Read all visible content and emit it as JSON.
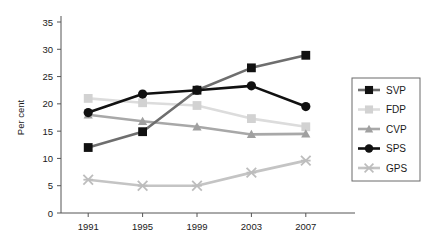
{
  "chart_data": {
    "type": "line",
    "title": "",
    "subtitle": "",
    "xlabel": "",
    "ylabel": "Per cent",
    "categories": [
      "1991",
      "1995",
      "1999",
      "2003",
      "2007"
    ],
    "x": [
      1991,
      1995,
      1999,
      2003,
      2007
    ],
    "ylim": [
      0,
      35
    ],
    "yticks": [
      0,
      5,
      10,
      15,
      20,
      25,
      30,
      35
    ],
    "ytick_labels": [
      "0",
      "5",
      "10",
      "15",
      "20",
      "25",
      "30",
      "35"
    ],
    "xtick_labels": [
      "1991",
      "1995",
      "1999",
      "2003",
      "2007"
    ],
    "grid": false,
    "legend_position": "right",
    "series": [
      {
        "name": "SVP",
        "values": [
          12.0,
          14.9,
          22.5,
          26.6,
          28.9
        ],
        "line_color": "#6e6e6e",
        "marker_color": "#111111",
        "marker": "square"
      },
      {
        "name": "FDP",
        "values": [
          21.0,
          20.2,
          19.7,
          17.3,
          15.8
        ],
        "line_color": "#dcdcdc",
        "marker_color": "#d2d2d2",
        "marker": "square"
      },
      {
        "name": "CVP",
        "values": [
          18.0,
          16.8,
          15.8,
          14.4,
          14.5
        ],
        "line_color": "#a8a8a8",
        "marker_color": "#a0a0a0",
        "marker": "triangle"
      },
      {
        "name": "SPS",
        "values": [
          18.4,
          21.8,
          22.5,
          23.3,
          19.5
        ],
        "line_color": "#111111",
        "marker_color": "#111111",
        "marker": "circle"
      },
      {
        "name": "GPS",
        "values": [
          6.1,
          5.0,
          5.0,
          7.4,
          9.6
        ],
        "line_color": "#c4c4c4",
        "marker_color": "#bdbdbd",
        "marker": "cross"
      }
    ]
  },
  "legend": {
    "items": [
      {
        "label": "SVP"
      },
      {
        "label": "FDP"
      },
      {
        "label": "CVP"
      },
      {
        "label": "SPS"
      },
      {
        "label": "GPS"
      }
    ]
  },
  "colors": {
    "axis": "#555555",
    "text": "#1a1a1a",
    "background": "#ffffff",
    "legend_border": "#6a6a6a"
  }
}
